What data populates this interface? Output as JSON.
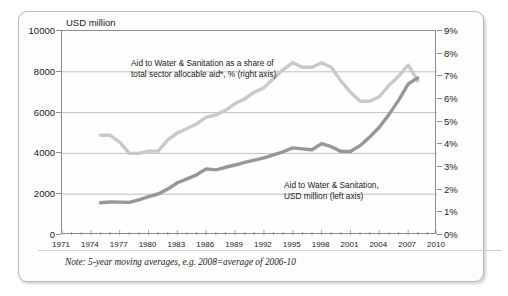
{
  "chart_data": {
    "type": "line",
    "title": "",
    "subtitle": "",
    "xlabel": "",
    "ylabel": "USD million",
    "y2label": "",
    "xlim": [
      1971,
      2010
    ],
    "ylim": [
      0,
      10000
    ],
    "y2lim": [
      0,
      9
    ],
    "grid": true,
    "legend_position": "inline-annotations",
    "x_ticks": [
      1971,
      1974,
      1977,
      1980,
      1983,
      1986,
      1989,
      1992,
      1995,
      1998,
      2001,
      2004,
      2007,
      2010
    ],
    "x_tick_labels": [
      "1971",
      "1974",
      "1977",
      "1980",
      "1983",
      "1986",
      "1989",
      "1992",
      "1995",
      "1998",
      "2001",
      "2004",
      "2007",
      "2010"
    ],
    "x_minor_tick_interval": 1,
    "y_ticks": [
      0,
      2000,
      4000,
      6000,
      8000,
      10000
    ],
    "y_tick_labels": [
      "0",
      "2000",
      "4000",
      "6000",
      "8000",
      "10000"
    ],
    "y2_ticks": [
      0,
      1,
      2,
      3,
      4,
      5,
      6,
      7,
      8,
      9
    ],
    "y2_tick_labels": [
      "0%",
      "1%",
      "2%",
      "3%",
      "4%",
      "5%",
      "6%",
      "7%",
      "8%",
      "9%"
    ],
    "series": [
      {
        "name": "Aid to Water & Sanitation as a share of total sector allocable aid*, % (right axis)",
        "axis": "right",
        "color": "#c9c9c9",
        "unit": "%",
        "x": [
          1975,
          1976,
          1977,
          1978,
          1979,
          1980,
          1981,
          1982,
          1983,
          1984,
          1985,
          1986,
          1987,
          1988,
          1989,
          1990,
          1991,
          1992,
          1993,
          1994,
          1995,
          1996,
          1997,
          1998,
          1999,
          2000,
          2001,
          2002,
          2003,
          2004,
          2005,
          2006,
          2007,
          2008
        ],
        "values": [
          4.4,
          4.4,
          4.1,
          3.6,
          3.6,
          3.7,
          3.7,
          4.2,
          4.5,
          4.7,
          4.9,
          5.2,
          5.3,
          5.5,
          5.8,
          6.0,
          6.3,
          6.5,
          6.9,
          7.3,
          7.6,
          7.4,
          7.4,
          7.6,
          7.4,
          6.8,
          6.3,
          5.9,
          5.9,
          6.1,
          6.6,
          7.0,
          7.5,
          6.8
        ]
      },
      {
        "name": "Aid to Water & Sanitation, USD million (left axis)",
        "axis": "left",
        "color": "#979797",
        "unit": "USD million",
        "x": [
          1975,
          1976,
          1977,
          1978,
          1979,
          1980,
          1981,
          1982,
          1983,
          1984,
          1985,
          1986,
          1987,
          1988,
          1989,
          1990,
          1991,
          1992,
          1993,
          1994,
          1995,
          1996,
          1997,
          1998,
          1999,
          2000,
          2001,
          2002,
          2003,
          2004,
          2005,
          2006,
          2007,
          2008
        ],
        "values": [
          1580,
          1620,
          1610,
          1600,
          1720,
          1880,
          2010,
          2250,
          2560,
          2750,
          2950,
          3240,
          3190,
          3320,
          3430,
          3560,
          3670,
          3780,
          3930,
          4080,
          4270,
          4220,
          4180,
          4480,
          4330,
          4100,
          4090,
          4380,
          4800,
          5280,
          5900,
          6600,
          7400,
          7700
        ]
      }
    ],
    "annotations": [
      {
        "id": "annotation-share",
        "lines": [
          "Aid to Water & Sanitation  as a share of",
          "total sector allocable aid*, % (right axis)"
        ]
      },
      {
        "id": "annotation-volume",
        "lines": [
          "Aid to Water & Sanitation,",
          "USD million (left axis)"
        ]
      }
    ],
    "note": "Note: 5-year moving averages, e.g. 2008=average of 2006-10"
  }
}
